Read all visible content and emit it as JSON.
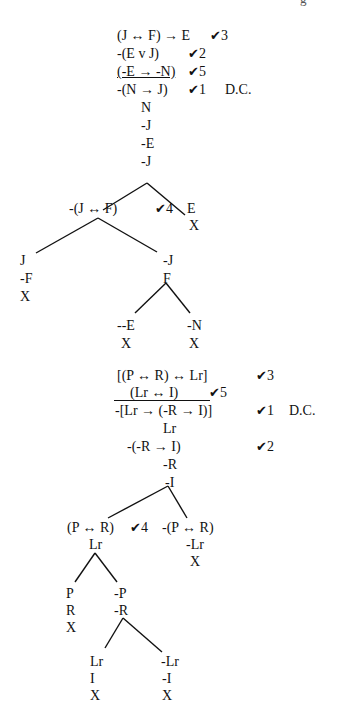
{
  "page_fragment": "g",
  "tree1": {
    "premises": [
      {
        "formula": "(J ↔ F) → E",
        "check": "✔",
        "step": "3",
        "underline": false,
        "note": ""
      },
      {
        "formula": "-(E v J)",
        "check": "✔",
        "step": "2",
        "underline": false,
        "note": ""
      },
      {
        "formula": "(-E → -N)",
        "check": "✔",
        "step": "5",
        "underline": true,
        "note": ""
      },
      {
        "formula": "-(N → J)",
        "check": "✔",
        "step": "1",
        "underline": false,
        "note": "D.C."
      }
    ],
    "trunk": [
      "N",
      "-J",
      "-E",
      "-J"
    ],
    "branch_left": {
      "formula": "-(J ↔ F)",
      "check": "✔",
      "step": "4"
    },
    "branch_right": [
      "E",
      "X"
    ],
    "sub_left": [
      "J",
      "-F",
      "X"
    ],
    "sub_right": [
      "-J",
      "F"
    ],
    "leaf_left": [
      "--E",
      "X"
    ],
    "leaf_right": [
      "-N",
      "X"
    ]
  },
  "tree2": {
    "premises": [
      {
        "formula": "[(P ↔ R) ↔ Lr]",
        "check": "✔",
        "step": "3",
        "underline": false,
        "note": ""
      },
      {
        "formula": "(Lr ↔ I)",
        "check": "✔",
        "step": "5",
        "underline": true,
        "note": ""
      },
      {
        "formula": "-[Lr → (-R → I)]",
        "check": "✔",
        "step": "1",
        "underline": false,
        "note": "D.C."
      }
    ],
    "trunk_a": [
      "Lr"
    ],
    "trunk_b": {
      "formula": "-(-R → I)",
      "check": "✔",
      "step": "2"
    },
    "trunk_c": [
      "-R",
      "-I"
    ],
    "branch_left": {
      "formula": "(P ↔ R)",
      "check": "✔",
      "step": "4",
      "sub": "Lr"
    },
    "branch_right": [
      "-(P ↔ R)",
      "-Lr",
      "X"
    ],
    "sub_left": [
      "P",
      "R",
      "X"
    ],
    "sub_right": [
      "-P",
      "-R"
    ],
    "leaf_left": [
      "Lr",
      "I",
      "X"
    ],
    "leaf_right": [
      "-Lr",
      "-I",
      "X"
    ]
  }
}
